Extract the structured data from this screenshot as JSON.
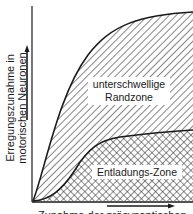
{
  "diagram": {
    "y_axis_label_line1": "Erregungszunahme in",
    "y_axis_label_line2": "motorischen Neuronen",
    "x_axis_label": "Zunahme der präsynaptischen",
    "zones": {
      "upper_line1": "unterschwellige",
      "upper_line2": "Randzone",
      "lower": "Entladungs-Zone"
    },
    "colors": {
      "line": "#1a1a1a",
      "background": "#ffffff"
    }
  }
}
